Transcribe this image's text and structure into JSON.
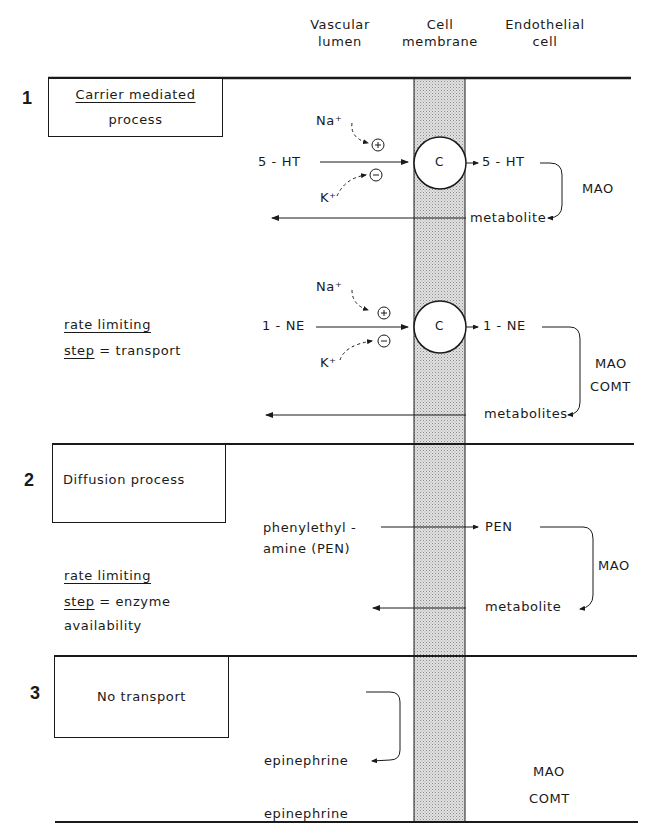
{
  "headers": {
    "lumen": [
      "Vascular",
      "lumen"
    ],
    "membrane": [
      "Cell",
      "membrane"
    ],
    "cell": [
      "Endothelial",
      "cell"
    ]
  },
  "sections": [
    {
      "number": "1",
      "box_lines": [
        "Carrier mediated",
        "process"
      ],
      "box_underlined_line": 0,
      "pathways": [
        {
          "substrate_in": "5 - HT",
          "substrate_out": "5 - HT",
          "stimulator_ion": "Na⁺",
          "inhibitor_ion": "K⁺",
          "stimulator_sign": "+",
          "inhibitor_sign": "−",
          "carrier_label": "C",
          "enzymes": [
            "MAO"
          ],
          "product": "metabolite"
        },
        {
          "substrate_in": "1 - NE",
          "substrate_out": "1 - NE",
          "stimulator_ion": "Na⁺",
          "inhibitor_ion": "K⁺",
          "stimulator_sign": "+",
          "inhibitor_sign": "−",
          "carrier_label": "C",
          "enzymes": [
            "MAO",
            "COMT"
          ],
          "product": "metabolites"
        }
      ],
      "note": {
        "line1": "rate limiting",
        "step_word": "step",
        "rest": " = transport"
      }
    },
    {
      "number": "2",
      "box_lines": [
        "Diffusion process"
      ],
      "pathway": {
        "substrate_in": [
          "phenylethyl -",
          "amine (PEN)"
        ],
        "substrate_out": "PEN",
        "enzymes": [
          "MAO"
        ],
        "product": "metabolite"
      },
      "note": {
        "line1": "rate limiting",
        "step_word": "step",
        "rest": " = enzyme",
        "line3": "availability"
      }
    },
    {
      "number": "3",
      "box_lines": [
        "No transport"
      ],
      "pathway": {
        "substrate_in": "epinephrine",
        "substrate_out": "epinephrine"
      },
      "enzymes": [
        "MAO",
        "COMT"
      ]
    }
  ],
  "colors": {
    "ink": "#1a1a1a",
    "membrane_fill": "#cfcfcf",
    "background": "#ffffff"
  }
}
